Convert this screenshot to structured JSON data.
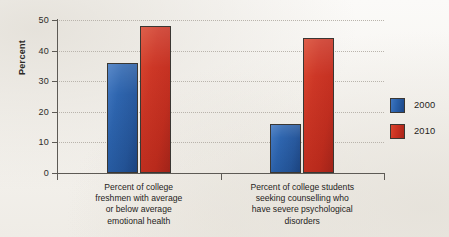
{
  "chart_data": {
    "type": "bar",
    "title": "",
    "xlabel": "",
    "ylabel": "Percent",
    "ylim": [
      0,
      50
    ],
    "yticks": [
      0,
      10,
      20,
      30,
      40,
      50
    ],
    "ytick_labels": [
      "0",
      "10",
      "20",
      "30",
      "40",
      "50"
    ],
    "grid": true,
    "legend_position": "right",
    "categories": [
      "Percent of college freshmen with average or below average emotional health",
      "Percent of college students seeking counselling who have severe psychological disorders"
    ],
    "category_label_lines": [
      [
        "Percent of college",
        "freshmen with average",
        "or below average",
        "emotional health"
      ],
      [
        "Percent of college students",
        "seeking counselling who",
        "have severe psychological",
        "disorders"
      ]
    ],
    "series": [
      {
        "name": "2000",
        "color": "#2a62ad",
        "values": [
          36,
          16
        ]
      },
      {
        "name": "2010",
        "color": "#cc3322",
        "values": [
          48,
          44
        ]
      }
    ]
  },
  "legend": {
    "items": [
      {
        "label": "2000",
        "color": "#2a62ad"
      },
      {
        "label": "2010",
        "color": "#cc3322"
      }
    ]
  },
  "axis": {
    "y_title": "Percent"
  }
}
